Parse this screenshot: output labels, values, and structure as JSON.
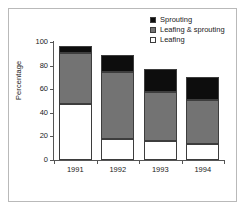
{
  "chart_data": {
    "type": "bar",
    "subtype": "stacked-bar",
    "title": "",
    "xlabel": "",
    "ylabel": "Percentage",
    "categories": [
      "1991",
      "1992",
      "1993",
      "1994"
    ],
    "ylim": [
      0,
      100
    ],
    "yticks": [
      0,
      20,
      40,
      60,
      80,
      100
    ],
    "ytick_labels": [
      "0",
      "20",
      "40",
      "60",
      "80",
      "100"
    ],
    "grid": false,
    "legend_position": "top-right",
    "series": [
      {
        "name": "Sprouting",
        "color": "#0d0d0d",
        "values": [
          6,
          14.5,
          19.5,
          19.5
        ]
      },
      {
        "name": "Leafing & sprouting",
        "color": "#737373",
        "values": [
          44,
          57,
          42,
          37.5
        ]
      },
      {
        "name": "Leafing",
        "color": "#ffffff",
        "values": [
          47,
          17.5,
          15.5,
          13
        ]
      }
    ],
    "stack_order_bottom_to_top": [
      "Leafing",
      "Leafing & sprouting",
      "Sprouting"
    ],
    "totals": [
      97,
      89,
      77,
      70
    ]
  },
  "legend": {
    "items": [
      {
        "label": "Sprouting",
        "color": "#0d0d0d"
      },
      {
        "label": "Leafing & sprouting",
        "color": "#737373"
      },
      {
        "label": "Leafing",
        "color": "#ffffff"
      }
    ]
  },
  "axes": {
    "y_label": "Percentage",
    "y_tick_labels": [
      "100",
      "80",
      "60",
      "40",
      "20",
      "0"
    ],
    "x_tick_labels": [
      "1991",
      "1992",
      "1993",
      "1994"
    ]
  }
}
